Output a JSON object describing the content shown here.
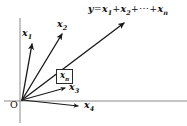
{
  "figure": {
    "type": "vector-diagram",
    "origin_label": "O",
    "sum_label": {
      "lhs": "y",
      "equals": "=",
      "term1": "x",
      "term1_sub": "1",
      "plus1": "+",
      "term2": "x",
      "term2_sub": "2",
      "plus2": "+",
      "ellipsis": "⋯",
      "plus3": "+",
      "termn": "x",
      "termn_sub": "n"
    },
    "boxed_label": {
      "symbol": "x",
      "subscript": "n"
    },
    "vectors": [
      {
        "name": "x1",
        "symbol": "x",
        "subscript": "1",
        "from": [
          22,
          100
        ],
        "to": [
          32,
          41
        ],
        "label_pos": [
          22,
          28
        ]
      },
      {
        "name": "x2",
        "symbol": "x",
        "subscript": "2",
        "from": [
          22,
          100
        ],
        "to": [
          63,
          31
        ],
        "label_pos": [
          57,
          19
        ]
      },
      {
        "name": "xn",
        "symbol": "x",
        "subscript": "n",
        "from": [
          22,
          100
        ],
        "to": [
          126,
          21
        ],
        "label_pos": [
          56,
          69
        ],
        "is_sum": true
      },
      {
        "name": "x3",
        "symbol": "x",
        "subscript": "3",
        "from": [
          22,
          100
        ],
        "to": [
          68,
          87
        ],
        "label_pos": [
          69,
          82
        ]
      },
      {
        "name": "x4",
        "symbol": "x",
        "subscript": "4",
        "from": [
          22,
          100
        ],
        "to": [
          81,
          106
        ],
        "label_pos": [
          84,
          100
        ]
      }
    ],
    "axes": {
      "vertical": {
        "x": 20,
        "y1": 18,
        "y2": 123
      },
      "horizontal": {
        "y": 101,
        "x1": 4,
        "x2": 187
      }
    },
    "colors": {
      "vector_stroke": "#1a1a1a",
      "axis_stroke": "#8a8a8a",
      "text": "#111111",
      "background": "#ffffff"
    }
  }
}
